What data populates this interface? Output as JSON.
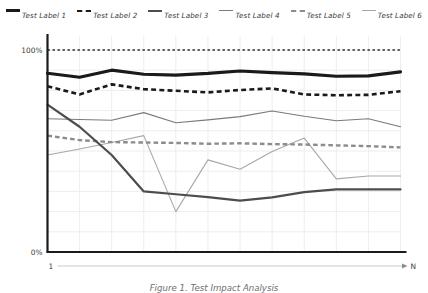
{
  "legend": {
    "items": [
      {
        "label": "Test Label 1",
        "style": "solid-thick",
        "color": "#1a1a1a"
      },
      {
        "label": "Test Label 2",
        "style": "dashed-thick",
        "color": "#1a1a1a"
      },
      {
        "label": "Test Label 3",
        "style": "solid-medium",
        "color": "#4d4d4d"
      },
      {
        "label": "Test Label 4",
        "style": "solid-thin",
        "color": "#7a7a7a"
      },
      {
        "label": "Test Label 5",
        "style": "dashed-medium",
        "color": "#8c8c8c"
      },
      {
        "label": "Test Label 6",
        "style": "solid-thin",
        "color": "#a8a8a8"
      }
    ]
  },
  "axes": {
    "y_top_label": "100%",
    "y_bottom_label": "0%",
    "x_start_label": "1",
    "x_end_label": "N",
    "x_axis_title": "Builds"
  },
  "caption": {
    "text": "Figure 1. Test Impact Analysis"
  },
  "chart_data": {
    "type": "line",
    "title": "",
    "xlabel": "Builds",
    "ylabel": "",
    "ylim": [
      0,
      105
    ],
    "ytick_labels": [
      "0%",
      "100%"
    ],
    "ytick_values": [
      0,
      100
    ],
    "xlim": [
      1,
      12
    ],
    "xtick_labels": [
      "1",
      "N"
    ],
    "grid": true,
    "grid_color": "#ededf2",
    "legend_position": "top",
    "x": [
      1,
      2,
      3,
      4,
      5,
      6,
      7,
      8,
      9,
      10,
      11,
      12
    ],
    "reference_line": {
      "name": "100% reference",
      "value": 100,
      "style": "dotted",
      "color": "#2b2b2b"
    },
    "series": [
      {
        "name": "Test Label 1",
        "color": "#1a1a1a",
        "style": "solid",
        "width": 3.2,
        "values": [
          88.5,
          86.5,
          90.0,
          88.0,
          87.6,
          88.4,
          89.6,
          88.8,
          88.2,
          87.0,
          87.2,
          89.2
        ]
      },
      {
        "name": "Test Label 2",
        "color": "#1a1a1a",
        "style": "dashed",
        "width": 2.6,
        "values": [
          82.0,
          78.0,
          83.0,
          80.6,
          79.8,
          79.0,
          80.2,
          81.0,
          78.0,
          77.6,
          77.8,
          79.6
        ]
      },
      {
        "name": "Test Label 3",
        "color": "#4d4d4d",
        "style": "solid",
        "width": 2.2,
        "values": [
          73.0,
          62.0,
          48.0,
          30.0,
          28.6,
          27.2,
          25.4,
          27.0,
          29.6,
          31.0,
          31.0,
          31.0
        ]
      },
      {
        "name": "Test Label 4",
        "color": "#7a7a7a",
        "style": "solid",
        "width": 1.1,
        "values": [
          66.0,
          65.6,
          65.2,
          69.0,
          64.0,
          65.4,
          67.0,
          69.8,
          67.2,
          65.0,
          66.0,
          62.0
        ]
      },
      {
        "name": "Test Label 5",
        "color": "#8c8c8c",
        "style": "dashed",
        "width": 2.4,
        "values": [
          57.6,
          55.4,
          54.4,
          54.2,
          54.0,
          53.6,
          53.8,
          53.4,
          53.2,
          52.8,
          52.4,
          51.8
        ]
      },
      {
        "name": "Test Label 6",
        "color": "#a8a8a8",
        "style": "solid",
        "width": 1.1,
        "values": [
          48.0,
          51.0,
          54.2,
          57.6,
          20.0,
          45.6,
          41.0,
          49.8,
          56.4,
          36.2,
          37.6,
          37.6
        ]
      }
    ]
  }
}
